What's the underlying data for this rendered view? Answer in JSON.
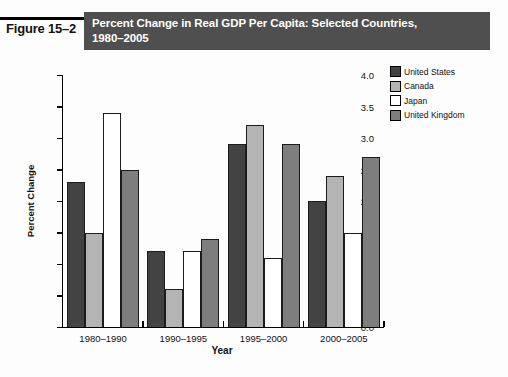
{
  "figure_label": "Figure 15–2",
  "header": {
    "title_line1": "Percent Change in Real GDP Per Capita: Selected Countries,",
    "title_line2": "1980–2005",
    "bg_color": "#4f4f4f",
    "text_color": "#ffffff"
  },
  "chart_data": {
    "type": "bar",
    "title": "Percent Change in Real GDP Per Capita: Selected Countries, 1980–2005",
    "categories": [
      "1980–1990",
      "1990–1995",
      "1995–2000",
      "2000–2005"
    ],
    "series": [
      {
        "name": "United States",
        "color": "#434343",
        "values": [
          2.3,
          1.2,
          2.9,
          2.0
        ]
      },
      {
        "name": "Canada",
        "color": "#b4b4b4",
        "values": [
          1.5,
          0.6,
          3.2,
          2.4
        ]
      },
      {
        "name": "Japan",
        "color": "#ffffff",
        "values": [
          3.4,
          1.2,
          1.1,
          1.5
        ]
      },
      {
        "name": "United Kingdom",
        "color": "#7e7e7e",
        "values": [
          2.5,
          1.4,
          2.9,
          2.7
        ]
      }
    ],
    "xlabel": "Year",
    "ylabel": "Percent Change",
    "ylim": [
      0.0,
      4.0
    ],
    "ytick_labels": [
      "0.0",
      "0.5",
      "1.0",
      "1.5",
      "2.0",
      "2.5",
      "3.0",
      "3.5",
      "4.0"
    ],
    "grid": false,
    "legend_position": "top-right",
    "bar_border_color": "#1c1c1c"
  }
}
